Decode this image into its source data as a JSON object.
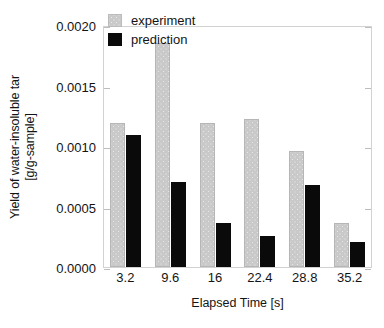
{
  "chart_data": {
    "type": "bar",
    "title": "",
    "xlabel": "Elapsed Time [s]",
    "ylabel_line1": "Yield of water-insoluble tar",
    "ylabel_line2": "[g/g-sample]",
    "categories": [
      "3.2",
      "9.6",
      "16",
      "22.4",
      "28.8",
      "35.2"
    ],
    "series": [
      {
        "name": "experiment",
        "color": "#c9c9c9",
        "values": [
          0.00119,
          0.00185,
          0.00119,
          0.00122,
          0.00096,
          0.00036
        ]
      },
      {
        "name": "prediction",
        "color": "#0a0a0a",
        "values": [
          0.00109,
          0.0007,
          0.00036,
          0.00026,
          0.00068,
          0.00021
        ]
      }
    ],
    "ylim": [
      0.0,
      0.002
    ],
    "yticks": [
      0.0,
      0.0005,
      0.001,
      0.0015,
      0.002
    ],
    "ytick_labels": [
      "0.0000",
      "0.0005",
      "0.0010",
      "0.0015",
      "0.0020"
    ],
    "grid": false,
    "legend_position": "top-center"
  },
  "legend": {
    "entries": [
      {
        "label": "experiment"
      },
      {
        "label": "prediction"
      }
    ]
  }
}
